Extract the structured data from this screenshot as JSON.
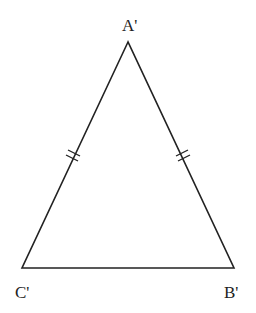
{
  "diagram": {
    "type": "isosceles-triangle",
    "stroke_color": "#222222",
    "vertices": {
      "apex": {
        "label": "A'",
        "x": 128,
        "y": 42
      },
      "bottom_left": {
        "label": "C'",
        "x": 22,
        "y": 268
      },
      "bottom_right": {
        "label": "B'",
        "x": 234,
        "y": 268
      }
    },
    "equal_side_marks": [
      "A'C'",
      "A'B'"
    ],
    "tick_count": 2
  }
}
